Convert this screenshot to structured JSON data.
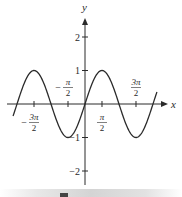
{
  "chart_data": {
    "type": "line",
    "title": "",
    "function": "y = sin(x)",
    "xlabel": "x",
    "ylabel": "y",
    "x_ticks": [
      {
        "value": -4.712389,
        "sign": "−",
        "num": "3π",
        "den": "2",
        "position": "below"
      },
      {
        "value": -1.570796,
        "sign": "−",
        "num": "π",
        "den": "2",
        "position": "above"
      },
      {
        "value": 1.570796,
        "sign": "",
        "num": "π",
        "den": "2",
        "position": "below"
      },
      {
        "value": 4.712389,
        "sign": "",
        "num": "3π",
        "den": "2",
        "position": "above"
      }
    ],
    "y_ticks": [
      {
        "value": 2,
        "label": "2"
      },
      {
        "value": 1,
        "label": "1"
      },
      {
        "value": -1,
        "label": "−1"
      },
      {
        "value": -2,
        "label": "−2"
      }
    ],
    "xlim": [
      -6.65,
      6.65
    ],
    "ylim": [
      -2.4,
      2.6
    ],
    "grid": false,
    "series": [
      {
        "name": "sin x",
        "x_start": -6.65,
        "x_end": 6.65,
        "color": "#2a2a2a",
        "samples": [
          {
            "x": -6.283,
            "y": 0
          },
          {
            "x": -4.712,
            "y": 1
          },
          {
            "x": -3.142,
            "y": 0
          },
          {
            "x": -1.571,
            "y": -1
          },
          {
            "x": 0,
            "y": 0
          },
          {
            "x": 1.571,
            "y": 1
          },
          {
            "x": 3.142,
            "y": 0
          },
          {
            "x": 4.712,
            "y": -1
          },
          {
            "x": 6.283,
            "y": 0
          }
        ]
      }
    ]
  },
  "layout": {
    "origin_px": [
      85,
      104
    ],
    "px_per_x_unit": 10.82,
    "px_per_y_unit": 33.5,
    "x_axis_px": [
      7,
      168
    ],
    "y_axis_px": [
      18,
      185
    ]
  },
  "colors": {
    "axis": "#2a2a2a",
    "curve": "#2a2a2a",
    "text": "#2a2a2a"
  }
}
